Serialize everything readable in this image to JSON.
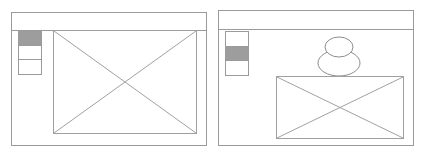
{
  "diagram": {
    "type": "wireframe-comparison",
    "background_color": "#ffffff",
    "line_color": "#9a9a9a",
    "highlight_color": "#9d9d9d"
  },
  "mockups": [
    {
      "id": "layout-variant-a",
      "label": "Layout variant A",
      "header": {
        "name": "header-bar",
        "label": ""
      },
      "nav": {
        "name": "vertical-nav",
        "selected_index": 0,
        "items": [
          {
            "label": "",
            "selected": true
          },
          {
            "label": "",
            "selected": false
          },
          {
            "label": "",
            "selected": false
          }
        ]
      },
      "content": {
        "image_placeholder": {
          "label": "",
          "crossed": true
        },
        "avatar": false
      }
    },
    {
      "id": "layout-variant-b",
      "label": "Layout variant B",
      "header": {
        "name": "header-bar",
        "label": ""
      },
      "nav": {
        "name": "vertical-nav",
        "selected_index": 1,
        "items": [
          {
            "label": "",
            "selected": false
          },
          {
            "label": "",
            "selected": true
          },
          {
            "label": "",
            "selected": false
          }
        ]
      },
      "content": {
        "image_placeholder": {
          "label": "",
          "crossed": true
        },
        "avatar": true,
        "avatar_label": ""
      }
    }
  ]
}
